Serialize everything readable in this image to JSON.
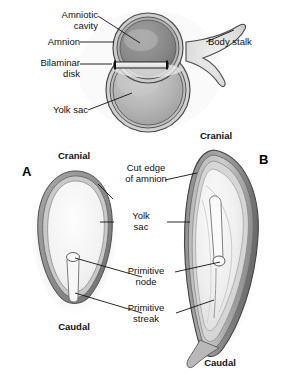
{
  "figure": {
    "background_color": "#ffffff",
    "width": 282,
    "height": 376,
    "ink_color": "#111111"
  },
  "panels": [
    {
      "id": "A",
      "label": "A",
      "caption_top": "Cranial",
      "caption_bottom": "Caudal"
    },
    {
      "id": "B",
      "label": "B",
      "caption_top": "Cranial",
      "caption_bottom": "Caudal"
    }
  ],
  "labels": {
    "amniotic_cavity": "Amniotic\ncavity",
    "amnion": "Amnion",
    "bilaminar_disk": "Bilaminar\ndisk",
    "yolk_sac_top": "Yolk sac",
    "body_stalk": "Body stalk",
    "cut_edge_of_amnion": "Cut edge\nof amnion",
    "yolk_sac_mid": "Yolk\nsac",
    "primitive_node": "Primitive\nnode",
    "primitive_streak": "Primitive\nstreak",
    "cranial_a": "Cranial",
    "caudal_a": "Caudal",
    "cranial_b": "Cranial",
    "caudal_b": "Caudal",
    "panel_a": "A",
    "panel_b": "B"
  },
  "colors": {
    "outline": "#3c3c3c",
    "amniotic_cavity_fill": "#8e8e8e",
    "yolk_sac_fill": "#b4b4b4",
    "membrane_light": "#d8d8d8",
    "membrane_mid": "#a9a9a9",
    "membrane_dark": "#6f6f6f",
    "disk_fill": "#efefef",
    "leader_line": "#1a1a1a"
  }
}
